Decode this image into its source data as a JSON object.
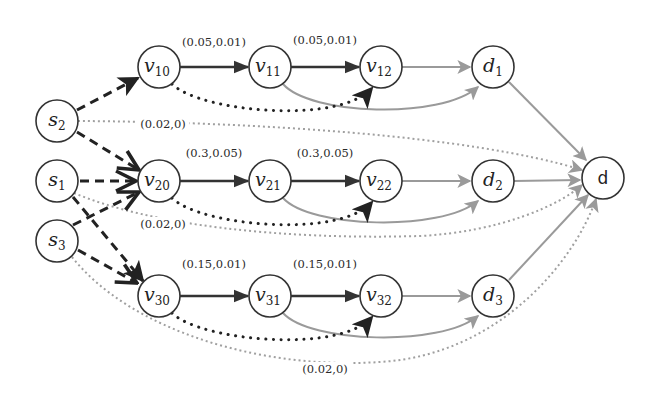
{
  "diagram": {
    "title": "",
    "colors": {
      "node_stroke": "#333333",
      "dashed_edge": "#222222",
      "chain_edge": "#333333",
      "dotted_dark_edge": "#222222",
      "gray_edge": "#9a9a9a",
      "dotted_gray_edge": "#a0a0a0"
    },
    "nodes": [
      {
        "id": "s2",
        "base": "s",
        "sub": "2",
        "x": 57,
        "y": 121
      },
      {
        "id": "s1",
        "base": "s",
        "sub": "1",
        "x": 57,
        "y": 181
      },
      {
        "id": "s3",
        "base": "s",
        "sub": "3",
        "x": 57,
        "y": 241
      },
      {
        "id": "v10",
        "base": "v",
        "sub": "10",
        "x": 159,
        "y": 67
      },
      {
        "id": "v11",
        "base": "v",
        "sub": "11",
        "x": 270,
        "y": 67
      },
      {
        "id": "v12",
        "base": "v",
        "sub": "12",
        "x": 381,
        "y": 67
      },
      {
        "id": "d1",
        "base": "d",
        "sub": "1",
        "x": 493,
        "y": 67
      },
      {
        "id": "v20",
        "base": "v",
        "sub": "20",
        "x": 159,
        "y": 181
      },
      {
        "id": "v21",
        "base": "v",
        "sub": "21",
        "x": 270,
        "y": 181
      },
      {
        "id": "v22",
        "base": "v",
        "sub": "22",
        "x": 381,
        "y": 181
      },
      {
        "id": "d2",
        "base": "d",
        "sub": "2",
        "x": 493,
        "y": 181
      },
      {
        "id": "v30",
        "base": "v",
        "sub": "30",
        "x": 159,
        "y": 296
      },
      {
        "id": "v31",
        "base": "v",
        "sub": "31",
        "x": 270,
        "y": 296
      },
      {
        "id": "v32",
        "base": "v",
        "sub": "32",
        "x": 381,
        "y": 296
      },
      {
        "id": "d3",
        "base": "d",
        "sub": "3",
        "x": 493,
        "y": 296
      },
      {
        "id": "d",
        "base": "d",
        "sub": "",
        "x": 603,
        "y": 178,
        "plain": true
      }
    ],
    "edge_labels": [
      {
        "id": "v10-v11",
        "text": "(0.05,0.01)",
        "x": 214,
        "y": 46
      },
      {
        "id": "v11-v12",
        "text": "(0.05,0.01)",
        "x": 325,
        "y": 44
      },
      {
        "id": "v20-v21",
        "text": "(0.3,0.05)",
        "x": 214,
        "y": 157
      },
      {
        "id": "v21-v22",
        "text": "(0.3,0.05)",
        "x": 325,
        "y": 157
      },
      {
        "id": "v30-v31",
        "text": "(0.15,0.01)",
        "x": 214,
        "y": 268
      },
      {
        "id": "v31-v32",
        "text": "(0.15,0.01)",
        "x": 325,
        "y": 268
      },
      {
        "id": "s2-d",
        "text": "(0.02,0)",
        "x": 163,
        "y": 128
      },
      {
        "id": "s1-d",
        "text": "(0.02,0)",
        "x": 163,
        "y": 228
      },
      {
        "id": "s3-d",
        "text": "(0.02,0)",
        "x": 325,
        "y": 373
      }
    ],
    "legend": {
      "dashed_black": "source to first-hop edges",
      "solid_dark": "chain edges with (cost, delay) labels",
      "dotted_black": "bypass edges",
      "solid_gray": "edges to sinks",
      "dotted_gray": "direct source-to-sink edges"
    }
  }
}
